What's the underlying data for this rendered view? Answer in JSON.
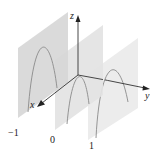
{
  "figure": {
    "type": "3d-trace-diagram",
    "axes": {
      "x": {
        "label": "x"
      },
      "y": {
        "label": "y"
      },
      "z": {
        "label": "z"
      }
    },
    "planes": [
      {
        "position_label": "−1",
        "shade": "#d4d4d4",
        "curve": "parabola-down"
      },
      {
        "position_label": "0",
        "shade": "#e2e2e2",
        "curve": "parabola-down"
      },
      {
        "position_label": "1",
        "shade": "#ececec",
        "curve": "parabola-down"
      }
    ],
    "colors": {
      "axis": "#333333",
      "curve": "#8a8a8a"
    }
  }
}
